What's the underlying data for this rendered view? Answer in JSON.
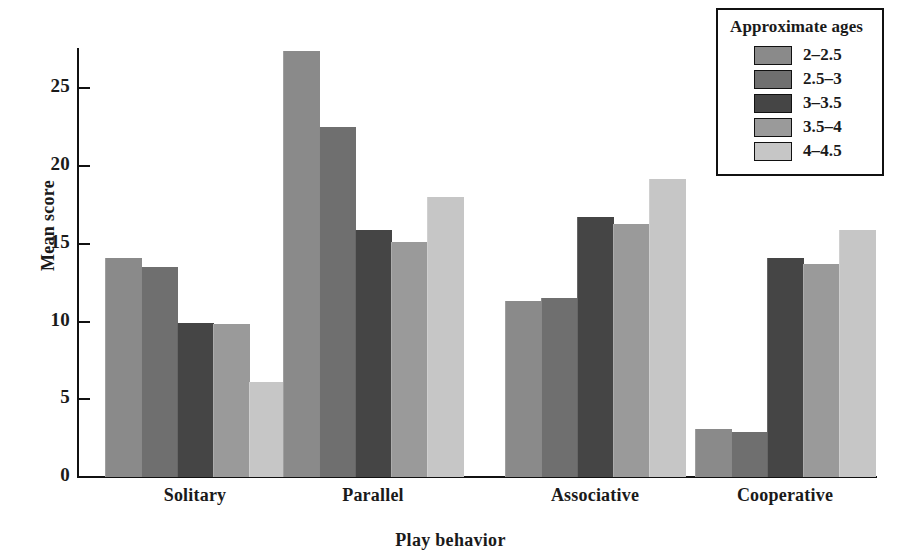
{
  "chart_data": {
    "type": "bar",
    "title": "",
    "xlabel": "Play behavior",
    "ylabel": "Mean score",
    "categories": [
      "Solitary",
      "Parallel",
      "Associative",
      "Cooperative"
    ],
    "ylim": [
      0,
      27.5
    ],
    "yticks": [
      0,
      5,
      10,
      15,
      20,
      25
    ],
    "ytick_labels": [
      "0",
      "5",
      "10",
      "15",
      "20",
      "25"
    ],
    "grid": false,
    "legend_position": "top-right",
    "legend_title": "Approximate ages",
    "series": [
      {
        "name": "2–2.5",
        "color": "#8a8a8a",
        "values": [
          14.1,
          27.4,
          11.3,
          3.1
        ]
      },
      {
        "name": "2.5–3",
        "color": "#6f6f6f",
        "values": [
          13.5,
          22.5,
          11.5,
          2.9
        ]
      },
      {
        "name": "3–3.5",
        "color": "#454545",
        "values": [
          9.9,
          15.9,
          16.7,
          14.1
        ]
      },
      {
        "name": "3.5–4",
        "color": "#9a9a9a",
        "values": [
          9.85,
          15.1,
          16.3,
          13.7
        ]
      },
      {
        "name": "4–4.5",
        "color": "#c6c6c6",
        "values": [
          6.1,
          18.0,
          19.2,
          15.9
        ]
      }
    ]
  }
}
